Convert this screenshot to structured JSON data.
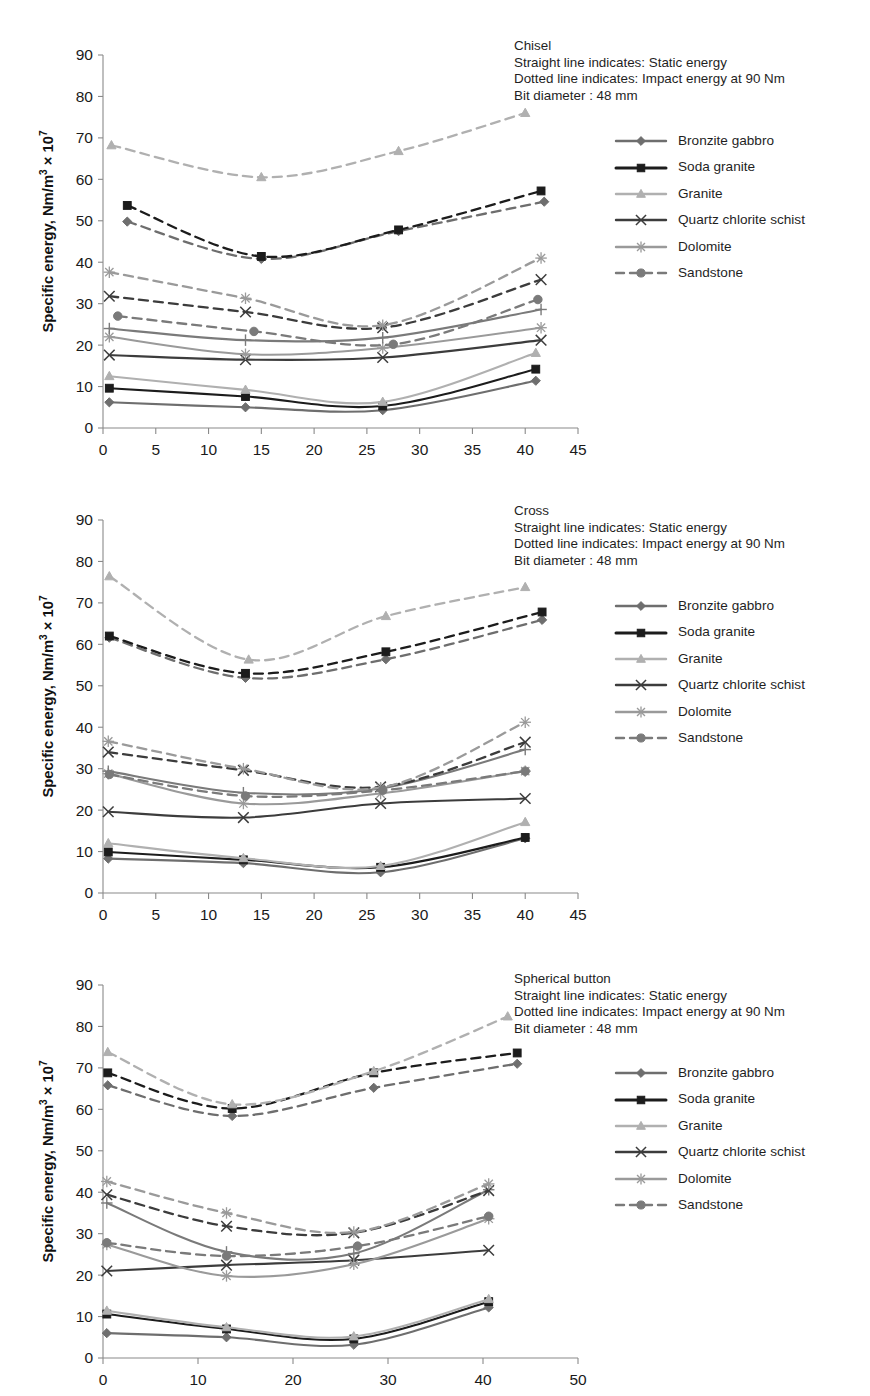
{
  "figure": {
    "y_axis_label_html": "Specific energy, Nm/m<sup>3</sup> &times; 10<sup>7</sup>",
    "x_axis_label": "Indexing angle, degree"
  },
  "legend": {
    "items": [
      {
        "label": "Bronzite gabbro",
        "color": "#6e6e6e",
        "marker": "diamond"
      },
      {
        "label": "Soda granite",
        "color": "#1c1c1c",
        "marker": "square"
      },
      {
        "label": "Granite",
        "color": "#b0b0b0",
        "marker": "triangle"
      },
      {
        "label": "Quartz chlorite schist",
        "color": "#3c3c3c",
        "marker": "cross"
      },
      {
        "label": "Dolomite",
        "color": "#9a9a9a",
        "marker": "star"
      },
      {
        "label": "Sandstone",
        "color": "#7a7a7a",
        "marker": "circle",
        "dashed": true
      }
    ]
  },
  "chart_data": [
    {
      "type": "line",
      "title": "Chisel",
      "annotation": [
        "Chisel",
        "Straight line indicates: Static energy",
        "Dotted line indicates: Impact energy at 90 Nm",
        "Bit diameter : 48 mm"
      ],
      "xlabel": "Indexing angle, degree",
      "ylabel": "Specific energy, Nm/m3 x 10^7",
      "xlim": [
        0,
        45
      ],
      "ylim": [
        0,
        90
      ],
      "xticks": [
        0,
        5,
        10,
        15,
        20,
        25,
        30,
        35,
        40,
        45
      ],
      "yticks": [
        0,
        10,
        20,
        30,
        40,
        50,
        60,
        70,
        80,
        90
      ],
      "grid": false,
      "legend_position": "right",
      "series": [
        {
          "name": "Bronzite gabbro static",
          "style": "solid",
          "color": "#6e6e6e",
          "marker": "diamond",
          "x": [
            0.6,
            13.5,
            26.5,
            41.0
          ],
          "y": [
            6.2,
            5.0,
            4.3,
            11.4
          ]
        },
        {
          "name": "Soda granite static",
          "style": "solid",
          "color": "#1c1c1c",
          "marker": "square",
          "x": [
            0.6,
            13.5,
            26.5,
            41.0
          ],
          "y": [
            9.6,
            7.6,
            5.3,
            14.2
          ]
        },
        {
          "name": "Granite static",
          "style": "solid",
          "color": "#b0b0b0",
          "marker": "triangle",
          "x": [
            0.6,
            13.5,
            26.5,
            41.0
          ],
          "y": [
            12.5,
            9.2,
            6.3,
            18.1
          ]
        },
        {
          "name": "Quartz chlorite schist static",
          "style": "solid",
          "color": "#3c3c3c",
          "marker": "cross",
          "x": [
            0.6,
            13.5,
            26.5,
            41.5
          ],
          "y": [
            17.6,
            16.5,
            17.0,
            21.2
          ]
        },
        {
          "name": "Dolomite static",
          "style": "solid",
          "color": "#9a9a9a",
          "marker": "star",
          "x": [
            0.6,
            13.5,
            26.5,
            41.5
          ],
          "y": [
            22.0,
            17.8,
            19.3,
            24.2
          ]
        },
        {
          "name": "Sandstone static",
          "style": "solid",
          "color": "#7a7a7a",
          "marker": "plus",
          "x": [
            0.6,
            13.5,
            26.5,
            41.5
          ],
          "y": [
            24.0,
            21.2,
            21.8,
            28.6
          ]
        },
        {
          "name": "Bronzite gabbro impact",
          "style": "dashed",
          "color": "#6e6e6e",
          "marker": "diamond",
          "x": [
            2.3,
            15.0,
            28.0,
            41.8
          ],
          "y": [
            49.8,
            40.8,
            47.5,
            54.6
          ]
        },
        {
          "name": "Soda granite impact",
          "style": "dashed",
          "color": "#1c1c1c",
          "marker": "square",
          "x": [
            2.3,
            15.0,
            28.0,
            41.5
          ],
          "y": [
            53.7,
            41.4,
            47.8,
            57.2
          ]
        },
        {
          "name": "Granite impact",
          "style": "dashed",
          "color": "#b0b0b0",
          "marker": "triangle",
          "x": [
            0.8,
            15.0,
            28.0,
            40.0
          ],
          "y": [
            68.2,
            60.5,
            66.8,
            76.0
          ]
        },
        {
          "name": "Quartz chlorite schist impact",
          "style": "dashed",
          "color": "#3c3c3c",
          "marker": "cross",
          "x": [
            0.6,
            13.5,
            26.5,
            41.5
          ],
          "y": [
            31.8,
            28.0,
            24.2,
            35.8
          ]
        },
        {
          "name": "Dolomite impact",
          "style": "dashed",
          "color": "#9a9a9a",
          "marker": "star",
          "x": [
            0.6,
            13.5,
            26.5,
            41.5
          ],
          "y": [
            37.6,
            31.3,
            24.8,
            41.0
          ]
        },
        {
          "name": "Sandstone impact",
          "style": "dashed",
          "color": "#7a7a7a",
          "marker": "circle",
          "x": [
            1.4,
            14.3,
            27.5,
            41.2
          ],
          "y": [
            27.0,
            23.3,
            20.2,
            31.0
          ]
        }
      ]
    },
    {
      "type": "line",
      "title": "Cross",
      "annotation": [
        "Cross",
        "Straight line indicates: Static energy",
        "Dotted line indicates: Impact energy at 90 Nm",
        "Bit diameter : 48 mm"
      ],
      "xlabel": "Indexing angle, degree",
      "ylabel": "Specific energy, Nm/m3 x 10^7",
      "xlim": [
        0,
        45
      ],
      "ylim": [
        0,
        90
      ],
      "xticks": [
        0,
        5,
        10,
        15,
        20,
        25,
        30,
        35,
        40,
        45
      ],
      "yticks": [
        0,
        10,
        20,
        30,
        40,
        50,
        60,
        70,
        80,
        90
      ],
      "grid": false,
      "legend_position": "right",
      "series": [
        {
          "name": "Bronzite gabbro static",
          "style": "solid",
          "color": "#6e6e6e",
          "marker": "diamond",
          "x": [
            0.5,
            13.3,
            26.3,
            40.0
          ],
          "y": [
            8.3,
            7.2,
            5.0,
            13.2
          ]
        },
        {
          "name": "Soda granite static",
          "style": "solid",
          "color": "#1c1c1c",
          "marker": "square",
          "x": [
            0.5,
            13.3,
            26.3,
            40.0
          ],
          "y": [
            9.9,
            8.0,
            6.2,
            13.4
          ]
        },
        {
          "name": "Granite static",
          "style": "solid",
          "color": "#b0b0b0",
          "marker": "triangle",
          "x": [
            0.5,
            13.3,
            26.3,
            40.0
          ],
          "y": [
            12.0,
            8.4,
            6.5,
            17.1
          ]
        },
        {
          "name": "Quartz chlorite schist static",
          "style": "solid",
          "color": "#3c3c3c",
          "marker": "cross",
          "x": [
            0.5,
            13.3,
            26.3,
            40.0
          ],
          "y": [
            19.6,
            18.2,
            21.6,
            22.8
          ]
        },
        {
          "name": "Dolomite static",
          "style": "solid",
          "color": "#9a9a9a",
          "marker": "star",
          "x": [
            0.5,
            13.3,
            26.3,
            40.0
          ],
          "y": [
            28.8,
            21.6,
            24.0,
            29.4
          ]
        },
        {
          "name": "Sandstone static",
          "style": "solid",
          "color": "#7a7a7a",
          "marker": "plus",
          "x": [
            0.5,
            13.3,
            26.3,
            40.0
          ],
          "y": [
            29.4,
            24.2,
            25.2,
            34.6
          ]
        },
        {
          "name": "Bronzite gabbro impact",
          "style": "dashed",
          "color": "#6e6e6e",
          "marker": "diamond",
          "x": [
            0.6,
            13.5,
            26.8,
            41.6
          ],
          "y": [
            61.6,
            51.9,
            56.4,
            65.9
          ]
        },
        {
          "name": "Soda granite impact",
          "style": "dashed",
          "color": "#1c1c1c",
          "marker": "square",
          "x": [
            0.6,
            13.5,
            26.8,
            41.6
          ],
          "y": [
            62.0,
            53.0,
            58.2,
            67.8
          ]
        },
        {
          "name": "Granite impact",
          "style": "dashed",
          "color": "#b0b0b0",
          "marker": "triangle",
          "x": [
            0.6,
            13.8,
            26.8,
            40.0
          ],
          "y": [
            76.4,
            56.3,
            66.8,
            73.8
          ]
        },
        {
          "name": "Quartz chlorite schist impact",
          "style": "dashed",
          "color": "#3c3c3c",
          "marker": "cross",
          "x": [
            0.5,
            13.3,
            26.3,
            40.0
          ],
          "y": [
            34.0,
            29.6,
            25.6,
            36.4
          ]
        },
        {
          "name": "Dolomite impact",
          "style": "dashed",
          "color": "#9a9a9a",
          "marker": "star",
          "x": [
            0.5,
            13.3,
            26.3,
            40.0
          ],
          "y": [
            36.6,
            30.0,
            25.4,
            41.2
          ]
        },
        {
          "name": "Sandstone impact",
          "style": "dashed",
          "color": "#7a7a7a",
          "marker": "circle",
          "x": [
            0.6,
            13.5,
            26.5,
            40.0
          ],
          "y": [
            28.6,
            23.4,
            24.8,
            29.4
          ]
        }
      ]
    },
    {
      "type": "line",
      "title": "Spherical button",
      "annotation": [
        "Spherical button",
        "Straight line indicates: Static energy",
        "Dotted line indicates: Impact energy at 90 Nm",
        "Bit diameter : 48 mm"
      ],
      "xlabel": "Indexing angle, degree",
      "ylabel": "Specific energy, Nm/m3 x 10^7",
      "xlim": [
        0,
        50
      ],
      "ylim": [
        0,
        90
      ],
      "xticks": [
        0,
        10,
        20,
        30,
        40,
        50
      ],
      "yticks": [
        0,
        10,
        20,
        30,
        40,
        50,
        60,
        70,
        80,
        90
      ],
      "grid": false,
      "legend_position": "right",
      "series": [
        {
          "name": "Bronzite gabbro static",
          "style": "solid",
          "color": "#6e6e6e",
          "marker": "diamond",
          "x": [
            0.4,
            13.0,
            26.4,
            40.6
          ],
          "y": [
            6.0,
            5.0,
            3.2,
            12.2
          ]
        },
        {
          "name": "Soda granite static",
          "style": "solid",
          "color": "#1c1c1c",
          "marker": "square",
          "x": [
            0.4,
            13.0,
            26.4,
            40.6
          ],
          "y": [
            10.6,
            7.0,
            4.6,
            13.6
          ]
        },
        {
          "name": "Granite static",
          "style": "solid",
          "color": "#b0b0b0",
          "marker": "triangle",
          "x": [
            0.4,
            13.0,
            26.4,
            40.6
          ],
          "y": [
            11.4,
            7.4,
            5.2,
            14.2
          ]
        },
        {
          "name": "Quartz chlorite schist static",
          "style": "solid",
          "color": "#3c3c3c",
          "marker": "cross",
          "x": [
            0.4,
            13.0,
            26.4,
            40.6
          ],
          "y": [
            21.0,
            22.4,
            23.6,
            26.0
          ]
        },
        {
          "name": "Dolomite static",
          "style": "solid",
          "color": "#9a9a9a",
          "marker": "star",
          "x": [
            0.4,
            13.0,
            26.4,
            40.6
          ],
          "y": [
            27.4,
            19.8,
            22.6,
            33.6
          ]
        },
        {
          "name": "Sandstone static",
          "style": "solid",
          "color": "#7a7a7a",
          "marker": "plus",
          "x": [
            0.4,
            13.0,
            26.4,
            40.6
          ],
          "y": [
            37.4,
            25.6,
            25.2,
            40.6
          ]
        },
        {
          "name": "Bronzite gabbro impact",
          "style": "dashed",
          "color": "#6e6e6e",
          "marker": "diamond",
          "x": [
            0.5,
            13.6,
            28.5,
            43.6
          ],
          "y": [
            65.8,
            58.4,
            65.2,
            71.0
          ]
        },
        {
          "name": "Soda granite impact",
          "style": "dashed",
          "color": "#1c1c1c",
          "marker": "square",
          "x": [
            0.5,
            13.6,
            28.5,
            43.6
          ],
          "y": [
            68.8,
            60.2,
            68.8,
            73.6
          ]
        },
        {
          "name": "Granite impact",
          "style": "dashed",
          "color": "#b0b0b0",
          "marker": "triangle",
          "x": [
            0.5,
            13.6,
            28.5,
            42.6
          ],
          "y": [
            73.8,
            61.2,
            69.2,
            82.4
          ]
        },
        {
          "name": "Quartz chlorite schist impact",
          "style": "dashed",
          "color": "#3c3c3c",
          "marker": "cross",
          "x": [
            0.4,
            13.0,
            26.4,
            40.6
          ],
          "y": [
            39.4,
            31.8,
            30.2,
            40.4
          ]
        },
        {
          "name": "Dolomite impact",
          "style": "dashed",
          "color": "#9a9a9a",
          "marker": "star",
          "x": [
            0.4,
            13.0,
            26.4,
            40.6
          ],
          "y": [
            42.6,
            35.0,
            30.4,
            42.0
          ]
        },
        {
          "name": "Sandstone impact",
          "style": "dashed",
          "color": "#7a7a7a",
          "marker": "circle",
          "x": [
            0.4,
            13.0,
            26.8,
            40.6
          ],
          "y": [
            27.8,
            24.6,
            27.0,
            34.2
          ]
        }
      ]
    }
  ]
}
